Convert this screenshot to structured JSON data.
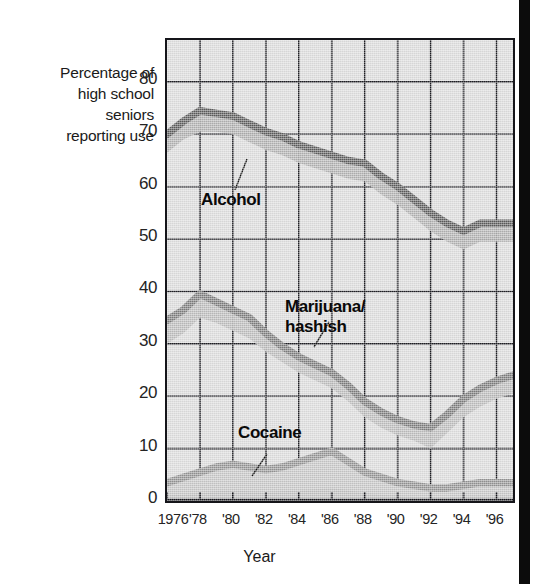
{
  "figure": {
    "y_axis_caption_lines": [
      "Percentage of",
      "high school",
      "seniors",
      "reporting use"
    ],
    "x_axis_title": "Year"
  },
  "chart_data": {
    "type": "area",
    "title": "",
    "subtitle": "",
    "xlabel": "Year",
    "ylabel": "Percentage of high school seniors reporting use",
    "grid": true,
    "legend_position": "in-plot-annotations",
    "xlim": [
      1976,
      1997
    ],
    "ylim": [
      0,
      88
    ],
    "ytick_values": [
      0,
      10,
      20,
      30,
      40,
      50,
      60,
      70,
      80
    ],
    "ytick_labels": [
      "0",
      "10",
      "20",
      "30",
      "40",
      "50",
      "60",
      "70",
      "80"
    ],
    "xtick_values": [
      1976,
      1978,
      1980,
      1982,
      1984,
      1986,
      1988,
      1990,
      1992,
      1994,
      1996
    ],
    "xtick_labels": [
      "1976",
      "'78",
      "'80",
      "'82",
      "'84",
      "'86",
      "'88",
      "'90",
      "'92",
      "'94",
      "'96"
    ],
    "x": [
      1976,
      1977,
      1978,
      1979,
      1980,
      1981,
      1982,
      1983,
      1984,
      1985,
      1986,
      1987,
      1988,
      1989,
      1990,
      1991,
      1992,
      1993,
      1994,
      1995,
      1996,
      1997
    ],
    "series": [
      {
        "name": "Alcohol",
        "label": "Alcohol",
        "color": "#585858",
        "band_color": "#a9a9a9",
        "upper": [
          70.0,
          72.5,
          74.5,
          74.0,
          73.5,
          72.0,
          70.5,
          69.5,
          68.0,
          67.0,
          66.0,
          65.0,
          64.5,
          62.0,
          60.0,
          57.5,
          55.0,
          53.0,
          51.5,
          53.0,
          53.0,
          53.0
        ],
        "lower": [
          66.5,
          69.0,
          70.5,
          70.5,
          70.0,
          68.5,
          67.0,
          66.0,
          64.5,
          63.5,
          62.5,
          61.5,
          61.0,
          58.5,
          56.5,
          54.0,
          51.5,
          49.5,
          48.0,
          49.5,
          49.5,
          49.5
        ],
        "values": [
          68.3,
          70.8,
          72.5,
          72.3,
          71.8,
          70.3,
          68.8,
          67.8,
          66.3,
          65.3,
          64.3,
          63.3,
          62.8,
          60.3,
          58.3,
          55.8,
          53.3,
          51.3,
          49.8,
          51.3,
          51.3,
          51.3
        ]
      },
      {
        "name": "Marijuana/hashish",
        "label": "Marijuana/\nhashish",
        "label_lines": [
          "Marijuana/",
          "hashish"
        ],
        "color": "#787878",
        "band_color": "#b4b4b4",
        "upper": [
          34.5,
          36.5,
          39.5,
          38.0,
          36.5,
          35.0,
          32.0,
          29.5,
          27.5,
          26.0,
          24.5,
          22.0,
          19.0,
          17.0,
          15.5,
          14.5,
          14.0,
          16.5,
          19.5,
          21.5,
          23.0,
          24.0
        ],
        "lower": [
          30.0,
          32.0,
          35.0,
          34.0,
          32.5,
          31.0,
          28.5,
          26.5,
          24.5,
          23.0,
          21.5,
          19.0,
          16.0,
          14.0,
          12.5,
          11.5,
          10.0,
          13.0,
          16.0,
          18.0,
          19.5,
          20.5
        ],
        "values": [
          32.3,
          34.3,
          37.3,
          36.0,
          34.5,
          33.0,
          30.3,
          28.0,
          26.0,
          24.5,
          23.0,
          20.5,
          17.5,
          15.5,
          14.0,
          13.0,
          12.0,
          14.8,
          17.8,
          19.8,
          21.3,
          22.3
        ]
      },
      {
        "name": "Cocaine",
        "label": "Cocaine",
        "color": "#8e8e8e",
        "band_color": "#c0c0c0",
        "upper": [
          3.5,
          4.5,
          5.5,
          6.5,
          7.0,
          6.5,
          6.0,
          6.5,
          7.5,
          8.5,
          9.5,
          7.5,
          5.5,
          4.5,
          3.5,
          3.0,
          2.5,
          2.5,
          3.0,
          3.5,
          3.5,
          3.5
        ],
        "lower": [
          1.0,
          1.2,
          1.5,
          1.8,
          2.0,
          1.8,
          1.6,
          1.8,
          2.0,
          2.2,
          2.5,
          2.0,
          1.5,
          1.2,
          1.0,
          0.8,
          0.7,
          0.7,
          0.8,
          1.0,
          1.0,
          1.0
        ],
        "values": [
          2.3,
          2.9,
          3.5,
          4.2,
          4.5,
          4.2,
          3.8,
          4.2,
          4.8,
          5.4,
          6.0,
          4.8,
          3.5,
          2.9,
          2.3,
          1.9,
          1.6,
          1.6,
          1.9,
          2.3,
          2.3,
          2.3
        ]
      }
    ],
    "annotations": [
      {
        "name": "alcohol-label",
        "text": "Alcohol",
        "x_px": 201,
        "y_px": 190
      },
      {
        "name": "marijuana-label",
        "text": "Marijuana/ hashish",
        "x_px": 285,
        "y_px": 307
      },
      {
        "name": "cocaine-label",
        "text": "Cocaine",
        "x_px": 238,
        "y_px": 429
      }
    ]
  }
}
